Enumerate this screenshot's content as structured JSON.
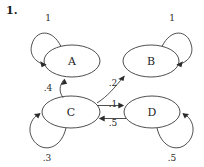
{
  "problem": {
    "number": "1."
  },
  "diagram": {
    "type": "markov-chain-state-diagram",
    "stroke_color": "#3a3a3a",
    "text_color": "#262626",
    "background_color": "#ffffff",
    "nodes": [
      {
        "id": "A",
        "label": "A",
        "cx": 72,
        "cy": 61,
        "rx": 28,
        "ry": 16
      },
      {
        "id": "B",
        "label": "B",
        "cx": 151,
        "cy": 61,
        "rx": 28,
        "ry": 16
      },
      {
        "id": "C",
        "label": "C",
        "cx": 71,
        "cy": 112,
        "rx": 29,
        "ry": 16
      },
      {
        "id": "D",
        "label": "D",
        "cx": 152,
        "cy": 112,
        "rx": 28,
        "ry": 16
      }
    ],
    "self_loops": [
      {
        "node": "A",
        "weight": "1",
        "label_x": 48,
        "label_y": 18
      },
      {
        "node": "B",
        "weight": "1",
        "label_x": 172,
        "label_y": 18
      },
      {
        "node": "C",
        "weight": ".3",
        "label_x": 47,
        "label_y": 158
      },
      {
        "node": "D",
        "weight": ".5",
        "label_x": 172,
        "label_y": 158
      }
    ],
    "edges": [
      {
        "from": "C",
        "to": "A",
        "weight": ".4",
        "label_x": 48,
        "label_y": 88
      },
      {
        "from": "C",
        "to": "B",
        "weight": ".2",
        "label_x": 113,
        "label_y": 83
      },
      {
        "from": "C",
        "to": "D",
        "weight": ".1",
        "label_x": 113,
        "label_y": 104
      },
      {
        "from": "D",
        "to": "C",
        "weight": ".5",
        "label_x": 113,
        "label_y": 123
      }
    ]
  }
}
